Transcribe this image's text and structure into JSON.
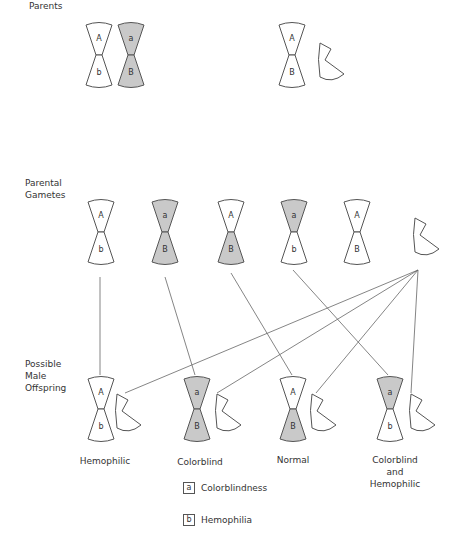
{
  "rows": {
    "parents": "Parents",
    "gametes_line1": "Parental",
    "gametes_line2": "Gametes",
    "offspring_line1": "Possible",
    "offspring_line2": "Male",
    "offspring_line3": "Offspring"
  },
  "colors": {
    "shaded": "#c9c9c9",
    "outline": "#555555",
    "line": "#666666"
  },
  "parents": {
    "mother": [
      {
        "top": "A",
        "bottom": "b",
        "top_shaded": false,
        "bottom_shaded": false
      },
      {
        "top": "a",
        "bottom": "B",
        "top_shaded": true,
        "bottom_shaded": true
      }
    ],
    "father": {
      "x": {
        "top": "A",
        "bottom": "B"
      },
      "y": "Y chromosome"
    }
  },
  "gametes": [
    {
      "top": "A",
      "bottom": "b",
      "top_shaded": false,
      "bottom_shaded": false
    },
    {
      "top": "a",
      "bottom": "B",
      "top_shaded": true,
      "bottom_shaded": true
    },
    {
      "top": "A",
      "bottom": "B",
      "top_shaded": false,
      "bottom_shaded": true
    },
    {
      "top": "a",
      "bottom": "b",
      "top_shaded": true,
      "bottom_shaded": false
    },
    {
      "top": "A",
      "bottom": "B",
      "top_shaded": false,
      "bottom_shaded": false
    },
    {
      "type": "Y"
    }
  ],
  "offspring": [
    {
      "top": "A",
      "bottom": "b",
      "top_shaded": false,
      "bottom_shaded": false,
      "label": "Hemophilic"
    },
    {
      "top": "a",
      "bottom": "B",
      "top_shaded": true,
      "bottom_shaded": true,
      "label": "Colorblind"
    },
    {
      "top": "A",
      "bottom": "B",
      "top_shaded": false,
      "bottom_shaded": true,
      "label": "Normal"
    },
    {
      "top": "a",
      "bottom": "b",
      "top_shaded": true,
      "bottom_shaded": false,
      "label_line1": "Colorblind",
      "label_line2": "and",
      "label_line3": "Hemophilic"
    }
  ],
  "legend": [
    {
      "symbol": "a",
      "text": "Colorblindness"
    },
    {
      "symbol": "b",
      "text": "Hemophilia"
    }
  ]
}
